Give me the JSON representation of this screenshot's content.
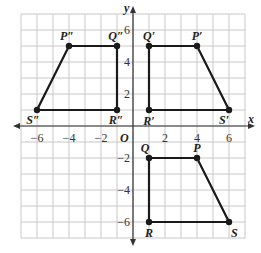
{
  "graph": {
    "x_axis_label": "x",
    "y_axis_label": "y",
    "origin_label": "O",
    "x_ticks": [
      {
        "v": -6,
        "t": "−6"
      },
      {
        "v": -4,
        "t": "−4"
      },
      {
        "v": -2,
        "t": "−2"
      },
      {
        "v": 2,
        "t": "2"
      },
      {
        "v": 4,
        "t": "4"
      },
      {
        "v": 6,
        "t": "6"
      }
    ],
    "y_ticks": [
      {
        "v": 6,
        "t": "6"
      },
      {
        "v": 4,
        "t": "4"
      },
      {
        "v": 2,
        "t": "2"
      },
      {
        "v": -2,
        "t": "−2"
      },
      {
        "v": -4,
        "t": "−4"
      },
      {
        "v": -6,
        "t": "−6"
      }
    ],
    "colors": {
      "grid": "#c8c8c8",
      "axis": "#333333",
      "shape": "#1a1a1a"
    }
  },
  "shapes": [
    {
      "name": "PQRS",
      "points": [
        {
          "label": "P",
          "x": 4,
          "y": -2
        },
        {
          "label": "Q",
          "x": 1,
          "y": -2
        },
        {
          "label": "R",
          "x": 1,
          "y": -6
        },
        {
          "label": "S",
          "x": 6,
          "y": -6
        }
      ]
    },
    {
      "name": "P'Q'R'S'",
      "points": [
        {
          "label": "P'",
          "x": 4,
          "y": 5
        },
        {
          "label": "Q'",
          "x": 1,
          "y": 5
        },
        {
          "label": "R'",
          "x": 1,
          "y": 1
        },
        {
          "label": "S'",
          "x": 6,
          "y": 1
        }
      ]
    },
    {
      "name": "P''Q''R''S''",
      "points": [
        {
          "label": "P''",
          "x": -4,
          "y": 5
        },
        {
          "label": "Q''",
          "x": -1,
          "y": 5
        },
        {
          "label": "R''",
          "x": -1,
          "y": 1
        },
        {
          "label": "S''",
          "x": -6,
          "y": 1
        }
      ]
    }
  ]
}
